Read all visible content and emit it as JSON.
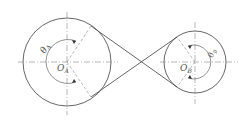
{
  "diagram": {
    "type": "crossed-belt-drive",
    "pulley_a": {
      "center_label": "O",
      "center_sub": "A",
      "angle_label": "θ",
      "angle_sub": "A",
      "cx": 67,
      "cy": 62,
      "r": 44
    },
    "pulley_b": {
      "center_label": "O",
      "center_sub": "B",
      "angle_label": "θ",
      "angle_sub": "B",
      "cx": 195,
      "cy": 62,
      "r": 31
    },
    "colors": {
      "line": "#555555",
      "centerline": "#888888",
      "background": "#ffffff"
    }
  }
}
